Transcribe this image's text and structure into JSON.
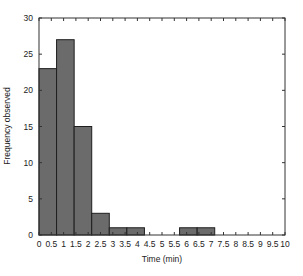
{
  "chart_data": {
    "type": "bar",
    "subtype": "histogram",
    "title": "",
    "xlabel": "Time (min)",
    "ylabel": "Frequency observed",
    "xlim": [
      0,
      10
    ],
    "ylim": [
      0,
      30
    ],
    "grid": false,
    "legend": null,
    "bin_width": 0.714,
    "bins": [
      {
        "x0": 0.0,
        "x1": 0.714,
        "count": 23
      },
      {
        "x0": 0.714,
        "x1": 1.429,
        "count": 27
      },
      {
        "x0": 1.429,
        "x1": 2.143,
        "count": 15
      },
      {
        "x0": 2.143,
        "x1": 2.857,
        "count": 3
      },
      {
        "x0": 2.857,
        "x1": 3.571,
        "count": 1
      },
      {
        "x0": 3.571,
        "x1": 4.286,
        "count": 1
      },
      {
        "x0": 4.286,
        "x1": 5.0,
        "count": 0
      },
      {
        "x0": 5.0,
        "x1": 5.714,
        "count": 0
      },
      {
        "x0": 5.714,
        "x1": 6.429,
        "count": 1
      },
      {
        "x0": 6.429,
        "x1": 7.143,
        "count": 1
      },
      {
        "x0": 7.143,
        "x1": 7.857,
        "count": 0
      },
      {
        "x0": 7.857,
        "x1": 8.571,
        "count": 0
      },
      {
        "x0": 8.571,
        "x1": 9.286,
        "count": 0
      },
      {
        "x0": 9.286,
        "x1": 10.0,
        "count": 0
      }
    ],
    "xticks": [
      0,
      0.5,
      1,
      1.5,
      2,
      2.5,
      3,
      3.5,
      4,
      4.5,
      5,
      5.5,
      6,
      6.5,
      7,
      7.5,
      8,
      8.5,
      9,
      9.5,
      10
    ],
    "xtick_labels": [
      "0",
      "0.5",
      "1",
      "1.5",
      "2",
      "2.5",
      "3",
      "3.5",
      "4",
      "4.5",
      "5",
      "5.5",
      "6",
      "6.5",
      "7",
      "7.5",
      "8",
      "8.5",
      "9",
      "9.5",
      "10"
    ],
    "yticks": [
      0,
      5,
      10,
      15,
      20,
      25,
      30
    ],
    "ytick_labels": [
      "0",
      "5",
      "10",
      "15",
      "20",
      "25",
      "30"
    ],
    "colors": {
      "bar_fill": "#6b6b6b",
      "bar_edge": "#1e1e1e",
      "axis": "#333333"
    }
  }
}
